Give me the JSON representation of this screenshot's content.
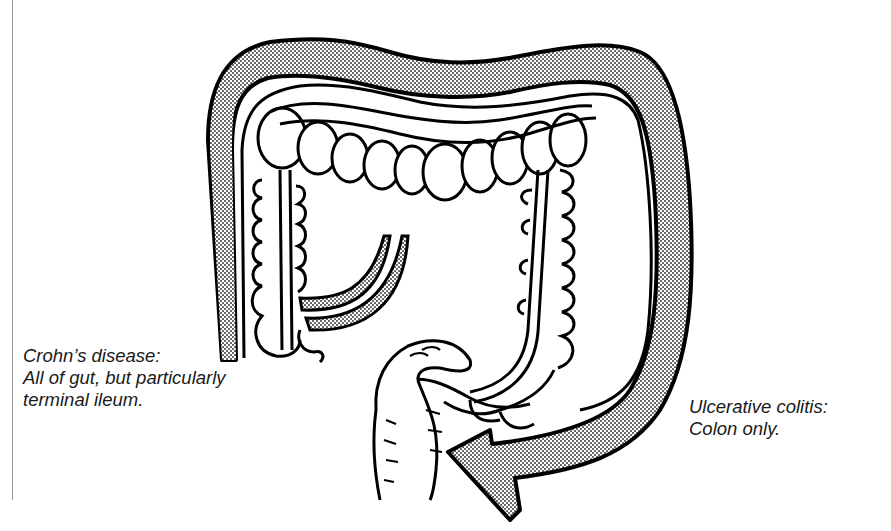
{
  "figure": {
    "labels": {
      "crohns": {
        "title": "Crohn’s disease:",
        "line1": "All of gut, but particularly",
        "line2": "terminal ileum."
      },
      "ulcerative_colitis": {
        "title": "Ulcerative colitis:",
        "line1": "Colon only."
      }
    },
    "shading": {
      "crohns_band": "stippled band along ascending colon and terminal ileum",
      "uc_band": "stippled arrow surrounding entire colon to rectum"
    },
    "colors": {
      "ink": "#000000",
      "stipple": "#8c8c8c",
      "text": "#1a1a1a",
      "background": "#ffffff"
    }
  }
}
